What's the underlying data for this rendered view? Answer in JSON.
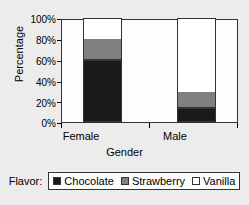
{
  "chart_data": {
    "type": "bar",
    "subtype": "stacked-100-percent",
    "title": "",
    "xlabel": "Gender",
    "ylabel": "Percentage",
    "categories": [
      "Female",
      "Male"
    ],
    "ylim": [
      0,
      100
    ],
    "ytick_labels": [
      "0%",
      "20%",
      "40%",
      "60%",
      "80%",
      "100%"
    ],
    "ytick_values": [
      0,
      20,
      40,
      60,
      80,
      100
    ],
    "grid": false,
    "legend_position": "bottom",
    "legend_title": "Flavor:",
    "series": [
      {
        "name": "Chocolate",
        "values": [
          60,
          13
        ],
        "color": "#1a1a1a"
      },
      {
        "name": "Strawberry",
        "values": [
          20,
          15
        ],
        "color": "#808080"
      },
      {
        "name": "Vanilla",
        "values": [
          20,
          72
        ],
        "color": "#ffffff"
      }
    ]
  },
  "axes": {
    "y_title": "Percentage",
    "x_title": "Gender",
    "y_ticks": [
      {
        "label": "100%",
        "value": 100
      },
      {
        "label": "80%",
        "value": 80
      },
      {
        "label": "60%",
        "value": 60
      },
      {
        "label": "40%",
        "value": 40
      },
      {
        "label": "20%",
        "value": 20
      },
      {
        "label": "0%",
        "value": 0
      }
    ],
    "x_categories": [
      {
        "label": "Female"
      },
      {
        "label": "Male"
      }
    ]
  },
  "legend": {
    "title": "Flavor:",
    "items": [
      {
        "label": "Chocolate",
        "color": "#1a1a1a"
      },
      {
        "label": "Strawberry",
        "color": "#808080"
      },
      {
        "label": "Vanilla",
        "color": "#ffffff"
      }
    ]
  },
  "colors": {
    "page_background": "#ececec",
    "plot_background": "#fdfdfd",
    "axis": "#333333",
    "chocolate": "#1a1a1a",
    "strawberry": "#808080",
    "vanilla": "#ffffff"
  }
}
